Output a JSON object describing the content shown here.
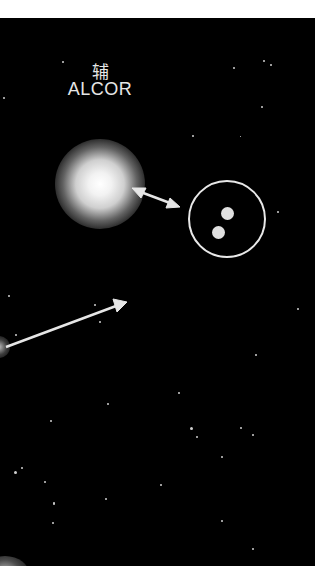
{
  "labels": {
    "chinese_name": "辅",
    "english_name": "ALCOR"
  },
  "colors": {
    "sky": "#000000",
    "frame": "#ffffff",
    "foreground": "#e6e6e6"
  },
  "objects": {
    "alcor": "glowing-star",
    "mizar": "double-star-in-circle",
    "pointer_arrow": "long-arrow",
    "link_arrow": "double-headed-arrow"
  }
}
